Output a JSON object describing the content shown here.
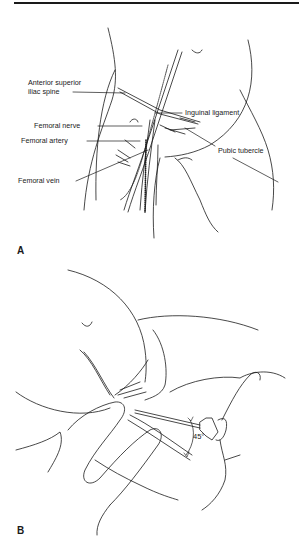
{
  "figure": {
    "panel_a": {
      "letter": "A",
      "labels": {
        "asis_line1": "Anterior superior",
        "asis_line2": "iliac spine",
        "inguinal_ligament": "Inguinal ligament",
        "femoral_nerve": "Femoral nerve",
        "femoral_artery": "Femoral artery",
        "pubic_tubercle": "Pubic tubercle",
        "femoral_vein": "Femoral vein"
      }
    },
    "panel_b": {
      "letter": "B",
      "angle_label": "45°"
    }
  },
  "colors": {
    "ink": "#1a1a1a",
    "background": "#ffffff"
  }
}
